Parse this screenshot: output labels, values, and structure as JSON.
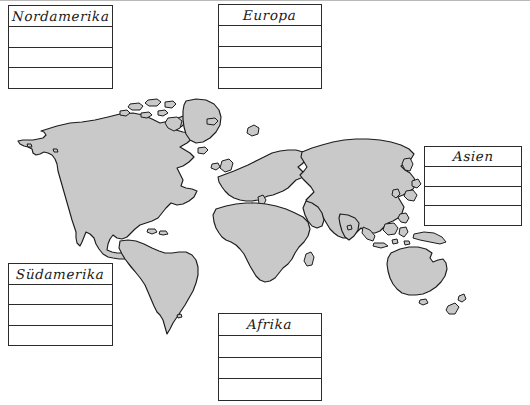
{
  "worksheet": {
    "title": "Weltkarte Kontinente Arbeitsblatt",
    "background_color": "#ffffff",
    "land_color": "#c9c9c9",
    "outline_color": "#1c1c1c",
    "box_border_color": "#2b2b2b"
  },
  "boxes": [
    {
      "id": "nordamerika",
      "title": "Nordamerika",
      "rows": [
        "",
        "",
        ""
      ],
      "blank_row_count": 3
    },
    {
      "id": "europa",
      "title": "Europa",
      "rows": [
        "",
        "",
        ""
      ],
      "blank_row_count": 3
    },
    {
      "id": "asien",
      "title": "Asien",
      "rows": [
        "",
        "",
        ""
      ],
      "blank_row_count": 3
    },
    {
      "id": "suedamerika",
      "title": "Südamerika",
      "rows": [
        "",
        "",
        ""
      ],
      "blank_row_count": 3
    },
    {
      "id": "afrika",
      "title": "Afrika",
      "rows": [
        "",
        "",
        ""
      ],
      "blank_row_count": 3
    }
  ],
  "map": {
    "projection": "world-outline",
    "landmasses": [
      "north-america",
      "greenland",
      "south-america",
      "europe",
      "africa",
      "asia",
      "australia",
      "new-zealand",
      "indonesia",
      "japan",
      "british-isles",
      "madagascar"
    ]
  }
}
